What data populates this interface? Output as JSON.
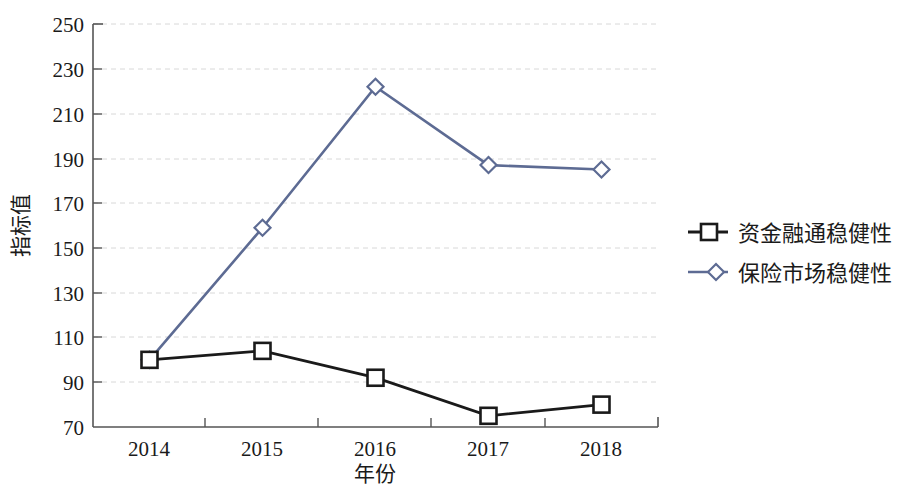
{
  "chart_data": {
    "type": "line",
    "title": "",
    "xlabel": "年份",
    "ylabel": "指标值",
    "categories": [
      "2014",
      "2015",
      "2016",
      "2017",
      "2018"
    ],
    "series": [
      {
        "name": "资金融通稳健性",
        "color": "#1a1a1a",
        "marker": "square",
        "values": [
          100,
          104,
          92,
          75,
          80
        ]
      },
      {
        "name": "保险市场稳健性",
        "color": "#5d6b93",
        "marker": "diamond",
        "values": [
          100,
          159,
          222,
          187,
          185
        ]
      }
    ],
    "ylim": [
      70,
      250
    ],
    "ytick_step": 20,
    "yticks": [
      "70",
      "90",
      "110",
      "130",
      "150",
      "170",
      "190",
      "210",
      "230",
      "250"
    ],
    "grid": "horizontal-dashed",
    "grid_color": "#d8d8d8",
    "legend_position": "right",
    "axis_color": "#555555"
  }
}
